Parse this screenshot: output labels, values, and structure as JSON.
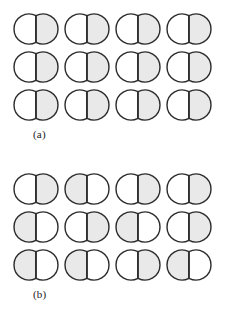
{
  "figure": {
    "background_color": "#ffffff",
    "shape_name": "bipartite-oval",
    "outline_color": "#2b2b2b",
    "divider_color": "#2b2b2b",
    "shaded_color": "#e9e9e9",
    "unshaded_color": "#ffffff",
    "outline_width": 1.4,
    "divider_width": 1.4,
    "rows": 3,
    "columns": 4
  },
  "panels": [
    {
      "id": "panel-a",
      "label": "(a)",
      "description": "ordered array: every element shaded on the right half",
      "cells": [
        [
          {
            "shaded_side": "right"
          },
          {
            "shaded_side": "right"
          },
          {
            "shaded_side": "right"
          },
          {
            "shaded_side": "right"
          }
        ],
        [
          {
            "shaded_side": "right"
          },
          {
            "shaded_side": "right"
          },
          {
            "shaded_side": "right"
          },
          {
            "shaded_side": "right"
          }
        ],
        [
          {
            "shaded_side": "right"
          },
          {
            "shaded_side": "right"
          },
          {
            "shaded_side": "right"
          },
          {
            "shaded_side": "right"
          }
        ]
      ]
    },
    {
      "id": "panel-b",
      "label": "(b)",
      "description": "disordered array: shaded half alternates between left and right",
      "cells": [
        [
          {
            "shaded_side": "right"
          },
          {
            "shaded_side": "left"
          },
          {
            "shaded_side": "right"
          },
          {
            "shaded_side": "right"
          }
        ],
        [
          {
            "shaded_side": "left"
          },
          {
            "shaded_side": "right"
          },
          {
            "shaded_side": "left"
          },
          {
            "shaded_side": "right"
          }
        ],
        [
          {
            "shaded_side": "left"
          },
          {
            "shaded_side": "left"
          },
          {
            "shaded_side": "right"
          },
          {
            "shaded_side": "left"
          }
        ]
      ]
    }
  ]
}
